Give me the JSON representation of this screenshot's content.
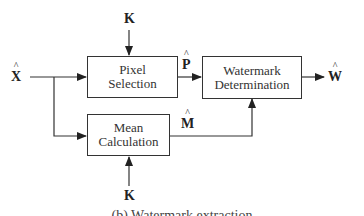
{
  "blocks": {
    "pixel_selection": {
      "line1": "Pixel",
      "line2": "Selection"
    },
    "mean_calculation": {
      "line1": "Mean",
      "line2": "Calculation"
    },
    "watermark_determination": {
      "line1": "Watermark",
      "line2": "Determination"
    }
  },
  "signals": {
    "input": "X",
    "key_top": "K",
    "key_bottom": "K",
    "pixels": "P",
    "mean": "M",
    "output": "W"
  },
  "caption": "(b) Watermark extraction"
}
